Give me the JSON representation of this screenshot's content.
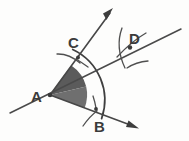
{
  "figure": {
    "background_color": "#fdfdfc",
    "ink_color": "#454545",
    "shade_color_upper": "#595959",
    "shade_color_lower": "#6f6f6f",
    "width": 189,
    "height": 141
  },
  "labels": {
    "vertex": "A",
    "arc_point_upper": "C",
    "arc_point_lower": "B",
    "bisector_point": "D"
  },
  "points": {
    "A": {
      "x": 50,
      "y": 95
    },
    "B": {
      "x": 96,
      "y": 109
    },
    "C": {
      "x": 78,
      "y": 57
    },
    "D": {
      "x": 130,
      "y": 47
    }
  },
  "label_positions": {
    "A": {
      "x": 33,
      "y": 101
    },
    "B": {
      "x": 97,
      "y": 128
    },
    "C": {
      "x": 72,
      "y": 42
    },
    "D": {
      "x": 133,
      "y": 40
    }
  },
  "rays": [
    {
      "name": "ray-AC-upper",
      "from": {
        "x": 50,
        "y": 95
      },
      "to": {
        "x": 110,
        "y": 12
      },
      "arrow": true
    },
    {
      "name": "ray-AB-lower",
      "from": {
        "x": 50,
        "y": 95
      },
      "to": {
        "x": 134,
        "y": 127
      },
      "arrow": true
    },
    {
      "name": "line-bisector-AD",
      "from": {
        "x": 11,
        "y": 112
      },
      "to": {
        "x": 181,
        "y": 29
      },
      "arrow": false
    }
  ],
  "arcs": {
    "main_arc_radius": 56,
    "main_arc_label": "arc centered at A through B and C",
    "small_arc_radius": 15,
    "small_arcs": [
      "arc-at-C",
      "arc-at-B",
      "arc-at-D-from-B",
      "arc-at-D-from-C"
    ]
  },
  "shaded_sectors": [
    {
      "name": "upper-sector-CAD",
      "color": "#5a5a5a"
    },
    {
      "name": "lower-sector-DAB",
      "color": "#6e6e6e"
    }
  ]
}
